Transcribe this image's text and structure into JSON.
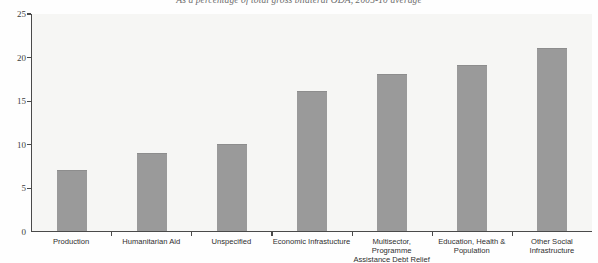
{
  "chart_data": {
    "type": "bar",
    "title": "As a percentage of total gross bilateral ODA, 2005-10 average",
    "xlabel": "",
    "ylabel": "",
    "ylim": [
      0,
      25
    ],
    "yticks": [
      0,
      5,
      10,
      15,
      20,
      25
    ],
    "grid": false,
    "legend": null,
    "orientation": "vertical",
    "bar_color": "#9a9a9a",
    "plot_background": "#f6f6f4",
    "axis_color": "#4a4a4a",
    "categories": [
      "Production",
      "Humanitarian Aid",
      "Unspecified",
      "Economic Infrastucture",
      "Multisector, Programme Assistance Debt Relief",
      "Education, Health & Population",
      "Other Social Infrastructure"
    ],
    "category_lines": [
      [
        "Production",
        ""
      ],
      [
        "Humanitarian Aid",
        ""
      ],
      [
        "Unspecified",
        ""
      ],
      [
        "Economic Infrastucture",
        ""
      ],
      [
        "Multisector, Programme",
        "Assistance Debt Relief"
      ],
      [
        "Education, Health &",
        "Population"
      ],
      [
        "Other Social",
        "Infrastructure"
      ]
    ],
    "values": [
      7,
      9,
      10,
      16,
      18,
      19,
      21
    ]
  }
}
